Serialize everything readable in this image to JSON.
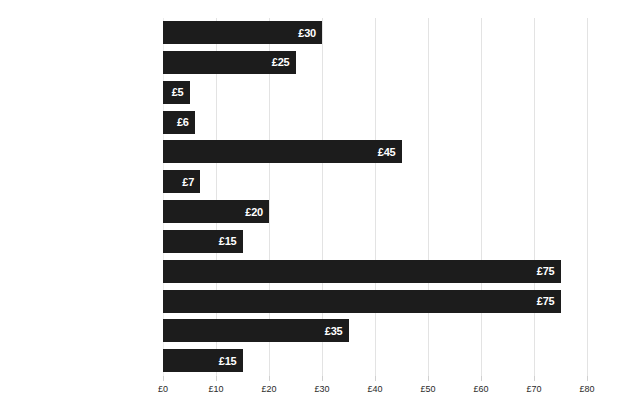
{
  "chart_data": {
    "type": "bar",
    "orientation": "horizontal",
    "title": "",
    "xlabel": "",
    "ylabel": "",
    "xlim": [
      0,
      80
    ],
    "grid": true,
    "legend": false,
    "currency_symbol": "£",
    "categories": [
      "Switch off standby",
      "Use a bowl for washing up",
      "Do one less wash a week",
      "Only fill the kettle with what you need",
      "Fit a water efficient shower head",
      "Spend one min less in your daily shower",
      "Draught proof doors and windows",
      "Install chimney draught excluder",
      "Use smart heating controls",
      "Turn your thermostat down one degree",
      "Replace all bulbs with LEDs",
      "Turn off your lights"
    ],
    "values": [
      30,
      25,
      5,
      6,
      45,
      7,
      20,
      15,
      75,
      75,
      35,
      15
    ],
    "value_labels": [
      "£30",
      "£25",
      "£5",
      "£6",
      "£45",
      "£7",
      "£20",
      "£15",
      "£75",
      "£75",
      "£35",
      "£15"
    ],
    "xticks": [
      0,
      10,
      20,
      30,
      40,
      50,
      60,
      70,
      80
    ],
    "xtick_labels": [
      "£0",
      "£10",
      "£20",
      "£30",
      "£40",
      "£50",
      "£60",
      "£70",
      "£80"
    ],
    "colors": {
      "bar": "#1c1c1c",
      "background": "#ffffff",
      "gridline": "#e3e3e3",
      "value_label": "#ffffff",
      "category_label": "#1a1a1a",
      "tick_label": "#2a2a2a"
    }
  }
}
